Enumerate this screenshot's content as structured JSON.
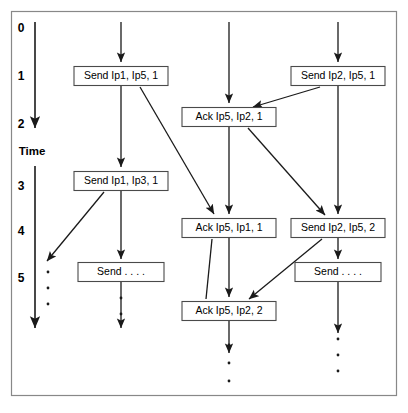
{
  "figure": {
    "background_color": "#ffffff",
    "frame_color": "#888888",
    "line_color": "#1a1a1a",
    "box_stroke_color": "#4a4a4a",
    "width": 408,
    "height": 413
  },
  "time_axis": {
    "label": "Time",
    "ticks": [
      "0",
      "1",
      "2",
      "3",
      "4",
      "5"
    ],
    "tick_values": [
      0,
      1,
      2,
      3,
      4,
      5
    ],
    "tick_positions_px": [
      28,
      76,
      124,
      186,
      231,
      278
    ],
    "label_position_px": 152,
    "axis_x_px": 35,
    "segments": [
      {
        "name": "upper-time-arrow",
        "y_start": 22,
        "y_end": 130
      },
      {
        "name": "lower-time-arrow",
        "y_start": 166,
        "y_end": 330
      }
    ],
    "direction": "downward"
  },
  "lifelines": [
    {
      "name": "lifeline-1",
      "x_px": 35,
      "label": ""
    },
    {
      "name": "lifeline-2",
      "x_px": 121,
      "label": ""
    },
    {
      "name": "lifeline-3",
      "x_px": 229,
      "label": ""
    },
    {
      "name": "lifeline-4",
      "x_px": 338,
      "label": ""
    }
  ],
  "events": [
    {
      "id": "send-ip1-ip5-1",
      "label": "Send Ip1, Ip5, 1",
      "lifeline": 2,
      "cx": 121,
      "cy": 76,
      "w": 94,
      "h": 19,
      "time": 1
    },
    {
      "id": "send-ip2-ip5-1",
      "label": "Send Ip2, Ip5, 1",
      "lifeline": 4,
      "cx": 338,
      "cy": 76,
      "w": 94,
      "h": 19,
      "time": 1
    },
    {
      "id": "ack-ip5-ip2-1",
      "label": "Ack  Ip5, Ip2, 1",
      "lifeline": 3,
      "cx": 229,
      "cy": 117,
      "w": 94,
      "h": 19,
      "time": 2
    },
    {
      "id": "send-ip1-ip3-1",
      "label": "Send Ip1, Ip3, 1",
      "lifeline": 2,
      "cx": 121,
      "cy": 181,
      "w": 94,
      "h": 19,
      "time": 3
    },
    {
      "id": "ack-ip5-ip1-1",
      "label": "Ack  Ip5, Ip1, 1",
      "lifeline": 3,
      "cx": 229,
      "cy": 228,
      "w": 94,
      "h": 19,
      "time": 4
    },
    {
      "id": "send-ip2-ip5-2",
      "label": "Send Ip2, Ip5, 2",
      "lifeline": 4,
      "cx": 338,
      "cy": 228,
      "w": 94,
      "h": 19,
      "time": 4
    },
    {
      "id": "send-ellipsis-left",
      "label": "Send  . . . .",
      "lifeline": 2,
      "cx": 121,
      "cy": 272,
      "w": 86,
      "h": 19,
      "time": 5
    },
    {
      "id": "send-ellipsis-right",
      "label": "Send  . . . .",
      "lifeline": 4,
      "cx": 338,
      "cy": 272,
      "w": 86,
      "h": 19,
      "time": 5
    },
    {
      "id": "ack-ip5-ip2-2",
      "label": "Ack  Ip5, Ip2, 2",
      "lifeline": 3,
      "cx": 229,
      "cy": 311,
      "w": 94,
      "h": 19,
      "time": 5
    }
  ],
  "messages": [
    {
      "id": "msg-ip1-to-ack-ip1",
      "from": "send-ip1-ip5-1",
      "to": "ack-ip5-ip1-1",
      "x1": 140,
      "y1": 87,
      "x2": 214,
      "y2": 216
    },
    {
      "id": "msg-ip2-to-ack-ip2",
      "from": "send-ip2-ip5-1",
      "to": "ack-ip5-ip2-1",
      "x1": 318,
      "y1": 87,
      "x2": 253,
      "y2": 108
    },
    {
      "id": "msg-ack-to-ip4",
      "from": "ack-ip5-ip2-1",
      "to": "send-ip2-ip5-2",
      "x1": 248,
      "y1": 128,
      "x2": 325,
      "y2": 216
    },
    {
      "id": "msg-ip3-to-dots",
      "from": "send-ip1-ip3-1",
      "to": "ellipsis-left",
      "x1": 104,
      "y1": 192,
      "x2": 48,
      "y2": 260
    },
    {
      "id": "msg-ackip1-to-ackip2",
      "from": "ack-ip5-ip1-1",
      "to": "ack-ip5-ip2-2",
      "x1": 212,
      "y1": 239,
      "x2": 205,
      "y2": 300
    },
    {
      "id": "msg-ip5-2-to-ackip2-2",
      "from": "send-ip2-ip5-2",
      "to": "ack-ip5-ip2-2",
      "x1": 320,
      "y1": 239,
      "x2": 248,
      "y2": 300
    }
  ],
  "ellipses": [
    {
      "id": "ellipsis-left",
      "x": 48,
      "dots_y": [
        272,
        288,
        304
      ]
    },
    {
      "id": "ellipsis-center",
      "x": 229,
      "dots_y": [
        344,
        362,
        380
      ]
    },
    {
      "id": "ellipsis-right",
      "x": 338,
      "dots_y": [
        344,
        362,
        380
      ]
    }
  ]
}
